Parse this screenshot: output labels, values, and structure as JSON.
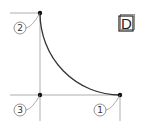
{
  "diagram": {
    "badge_letter": "D",
    "points": [
      {
        "id": "1",
        "label": "1"
      },
      {
        "id": "2",
        "label": "2"
      },
      {
        "id": "3",
        "label": "3"
      }
    ],
    "colors": {
      "curve": "#333333",
      "construction_lines": "#9a9a9a",
      "point": "#111111"
    }
  }
}
